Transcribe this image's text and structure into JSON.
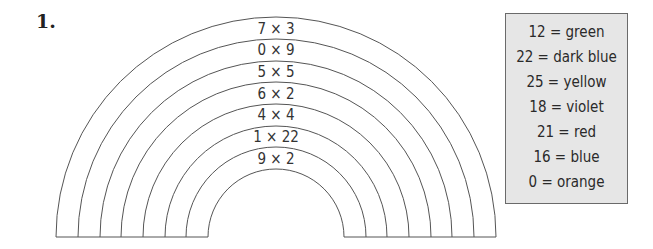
{
  "question": {
    "number": "1."
  },
  "rainbow": {
    "bands": [
      {
        "label": "7 × 3"
      },
      {
        "label": "0 × 9"
      },
      {
        "label": "5 × 5"
      },
      {
        "label": "6 × 2"
      },
      {
        "label": "4 × 4"
      },
      {
        "label": "1 × 22"
      },
      {
        "label": "9 × 2"
      }
    ]
  },
  "color_key": {
    "entries": [
      {
        "text": "12 = green"
      },
      {
        "text": "22 = dark blue"
      },
      {
        "text": "25 = yellow"
      },
      {
        "text": "18 = violet"
      },
      {
        "text": "21 = red"
      },
      {
        "text": "16 = blue"
      },
      {
        "text": "0 = orange"
      }
    ]
  }
}
